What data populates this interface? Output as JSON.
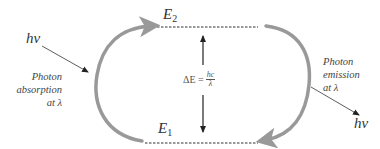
{
  "diagram": {
    "type": "energy-level transition cycle",
    "levels": [
      {
        "name": "E",
        "subscript": "2",
        "role": "upper"
      },
      {
        "name": "E",
        "subscript": "1",
        "role": "lower"
      }
    ],
    "energy_gap": {
      "lhs": "ΔE =",
      "numerator": "hc",
      "denominator": "λ"
    },
    "absorption": {
      "photon": "hν",
      "label_lines": [
        "Photon",
        "absorption",
        "at λ"
      ]
    },
    "emission": {
      "photon": "hν",
      "label_lines": [
        "Photon",
        "emission",
        "at λ"
      ]
    },
    "colors": {
      "cycle_arrow": "#999999",
      "text": "#333333",
      "lines": "#333333"
    }
  }
}
